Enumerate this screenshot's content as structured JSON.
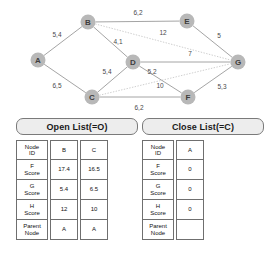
{
  "graph": {
    "nodes": [
      {
        "id": "A",
        "x": 38,
        "y": 60
      },
      {
        "id": "B",
        "x": 88,
        "y": 22
      },
      {
        "id": "C",
        "x": 92,
        "y": 97
      },
      {
        "id": "D",
        "x": 133,
        "y": 62
      },
      {
        "id": "E",
        "x": 187,
        "y": 21
      },
      {
        "id": "F",
        "x": 188,
        "y": 97
      },
      {
        "id": "G",
        "x": 238,
        "y": 62
      }
    ],
    "edges": [
      {
        "from": "A",
        "to": "B",
        "weight": "5,4",
        "style": "solid",
        "lx": 57,
        "ly": 37
      },
      {
        "from": "A",
        "to": "C",
        "weight": "6,5",
        "style": "solid",
        "lx": 57,
        "ly": 88
      },
      {
        "from": "B",
        "to": "D",
        "weight": "4,1",
        "style": "solid",
        "lx": 118,
        "ly": 44
      },
      {
        "from": "B",
        "to": "E",
        "weight": "6,2",
        "style": "solid",
        "lx": 138,
        "ly": 15
      },
      {
        "from": "B",
        "to": "G",
        "weight": "12",
        "style": "dotted",
        "lx": 163,
        "ly": 35
      },
      {
        "from": "C",
        "to": "D",
        "weight": "5,4",
        "style": "solid",
        "lx": 107,
        "ly": 74
      },
      {
        "from": "C",
        "to": "F",
        "weight": "6,2",
        "style": "solid",
        "lx": 139,
        "ly": 110
      },
      {
        "from": "C",
        "to": "G",
        "weight": "10",
        "style": "dotted",
        "lx": 160,
        "ly": 88
      },
      {
        "from": "D",
        "to": "G",
        "weight": "7",
        "style": "solid",
        "lx": 190,
        "ly": 56
      },
      {
        "from": "D",
        "to": "F",
        "weight": "5,2",
        "style": "solid",
        "lx": 152,
        "ly": 74
      },
      {
        "from": "E",
        "to": "G",
        "weight": "5",
        "style": "solid",
        "lx": 219,
        "ly": 38
      },
      {
        "from": "F",
        "to": "G",
        "weight": "5,3",
        "style": "solid",
        "lx": 222,
        "ly": 89
      }
    ]
  },
  "open_list": {
    "title": "Open List(=O)",
    "row_labels": [
      "Node ID",
      "F Score",
      "G Score",
      "H Score",
      "Parent Node"
    ],
    "columns": [
      {
        "node_id": "B",
        "f_score": "17.4",
        "g_score": "5.4",
        "h_score": "12",
        "parent": "A"
      },
      {
        "node_id": "C",
        "f_score": "16.5",
        "g_score": "6.5",
        "h_score": "10",
        "parent": "A"
      }
    ]
  },
  "close_list": {
    "title": "Close List(=C)",
    "row_labels": [
      "Node ID",
      "F Score",
      "G Score",
      "H Score",
      "Parent Node"
    ],
    "columns": [
      {
        "node_id": "A",
        "f_score": "0",
        "g_score": "0",
        "h_score": "0",
        "parent": ""
      }
    ]
  }
}
